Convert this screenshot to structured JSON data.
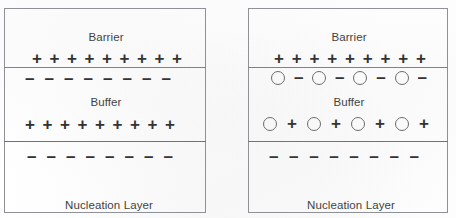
{
  "figure": {
    "kind": "semiconductor-layer-charge-diagram",
    "panel_count": 2,
    "symbols": {
      "positive_charge": "+",
      "negative_charge": "−",
      "vacancy": "vacancy-circle-icon"
    },
    "colors": {
      "background": "#ffffff",
      "border": "#8e9196",
      "divider": "#7e8186",
      "text": "#3d3d3d",
      "symbol": "#2e2e2e",
      "vacancy_outline": "#6a6a6a"
    }
  },
  "panels": [
    {
      "id": "left",
      "name": "panel-without-vacancies",
      "layers": [
        {
          "id": "barrier",
          "label": "Barrier",
          "label_align": "center"
        },
        {
          "id": "buffer",
          "label": "Buffer",
          "label_align": "center"
        },
        {
          "id": "nucleation",
          "label": "Nucleation Layer\nSubstrate",
          "label_align": "left"
        }
      ],
      "charge_rows": [
        {
          "id": "barrier-interface-positive",
          "interface": "barrier-buffer",
          "side": "above",
          "sequence": [
            "+",
            "+",
            "+",
            "+",
            "+",
            "+",
            "+",
            "+",
            "+"
          ]
        },
        {
          "id": "buffer-interface-negative",
          "interface": "barrier-buffer",
          "side": "below",
          "sequence": [
            "−",
            "−",
            "−",
            "−",
            "−",
            "−",
            "−",
            "−"
          ]
        },
        {
          "id": "buffer-bottom-positive",
          "interface": "buffer-nucleation",
          "side": "above",
          "sequence": [
            "+",
            "+",
            "+",
            "+",
            "+",
            "+",
            "+",
            "+",
            "+"
          ]
        },
        {
          "id": "nucleation-top-negative",
          "interface": "buffer-nucleation",
          "side": "below",
          "sequence": [
            "−",
            "−",
            "−",
            "−",
            "−",
            "−",
            "−",
            "−"
          ]
        }
      ]
    },
    {
      "id": "right",
      "name": "panel-with-vacancies",
      "layers": [
        {
          "id": "barrier",
          "label": "Barrier",
          "label_align": "center"
        },
        {
          "id": "buffer",
          "label": "Buffer",
          "label_align": "center"
        },
        {
          "id": "nucleation",
          "label": "Nucleation Layer\nSubstrate",
          "label_align": "left"
        }
      ],
      "charge_rows": [
        {
          "id": "barrier-interface-positive",
          "interface": "barrier-buffer",
          "side": "above",
          "sequence": [
            "+",
            "+",
            "+",
            "+",
            "+",
            "+",
            "+",
            "+",
            "+"
          ]
        },
        {
          "id": "buffer-interface-vacancy-negative",
          "interface": "barrier-buffer",
          "side": "below",
          "sequence": [
            "O",
            "−",
            "O",
            "−",
            "O",
            "−",
            "O",
            "−"
          ]
        },
        {
          "id": "buffer-bottom-vacancy-positive",
          "interface": "buffer-nucleation",
          "side": "above",
          "sequence": [
            "O",
            "+",
            "O",
            "+",
            "O",
            "+",
            "O",
            "+"
          ]
        },
        {
          "id": "nucleation-top-negative",
          "interface": "buffer-nucleation",
          "side": "below",
          "sequence": [
            "−",
            "−",
            "−",
            "−",
            "−",
            "−",
            "−",
            "−"
          ]
        }
      ]
    }
  ]
}
